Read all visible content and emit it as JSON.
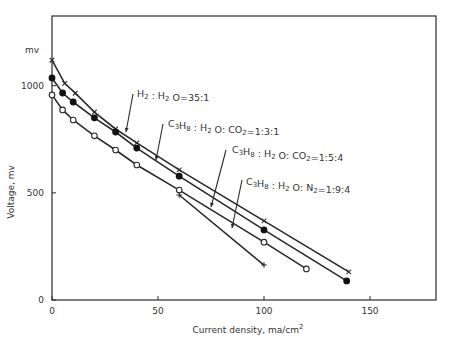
{
  "chart_data": {
    "type": "line",
    "title": "",
    "xlabel": "Current density, ma/cm",
    "xlabel_superscript": "2",
    "ylabel": "Voltage, mv",
    "y_unit_label": "mv",
    "xlim": [
      0,
      180
    ],
    "ylim": [
      0,
      1300
    ],
    "xticks": [
      0,
      50,
      100,
      150
    ],
    "yticks": [
      0,
      500,
      1000
    ],
    "xtick_labels": [
      "0",
      "50",
      "100",
      "150"
    ],
    "ytick_labels": [
      "0",
      "500",
      "1000"
    ],
    "grid": false,
    "legend": "inline annotations with arrows",
    "series": [
      {
        "name": "H2 : H2O = 35:1",
        "marker": "x",
        "x": [
          0,
          6,
          11,
          20,
          30,
          40,
          60,
          100,
          140
        ],
        "y": [
          1119,
          1011,
          965,
          877,
          798,
          733,
          607,
          369,
          131
        ]
      },
      {
        "name": "C3H8 : H2O : CO2 = 1:3:1",
        "marker": "filled-circle",
        "x": [
          0,
          5,
          10,
          20,
          30,
          40,
          60,
          100,
          139
        ],
        "y": [
          1036,
          966,
          924,
          850,
          784,
          709,
          578,
          327,
          89
        ]
      },
      {
        "name": "C3H8 : H2O : CO2 = 1:5:4",
        "marker": "open-circle",
        "x": [
          0,
          5,
          10,
          20,
          30,
          40,
          60,
          100,
          120
        ],
        "y": [
          957,
          887,
          840,
          766,
          700,
          630,
          513,
          270,
          145
        ]
      },
      {
        "name": "C3H8 : H2O : N2 = 1:9:4",
        "marker": "plus",
        "x": [
          60,
          100
        ],
        "y": [
          490,
          163
        ]
      }
    ],
    "annotations": [
      {
        "parts": [
          [
            "H",
            "2"
          ],
          [
            " : H",
            "2"
          ],
          [
            " O=35:1",
            ""
          ]
        ],
        "target_series": 0
      },
      {
        "parts": [
          [
            "C",
            "3"
          ],
          [
            "H",
            "8"
          ],
          [
            " : H",
            "2"
          ],
          [
            " O: CO",
            "2"
          ],
          [
            "=1:3:1",
            ""
          ]
        ],
        "target_series": 1
      },
      {
        "parts": [
          [
            "C",
            "3"
          ],
          [
            "H",
            "8"
          ],
          [
            " : H",
            "2"
          ],
          [
            " O: CO",
            "2"
          ],
          [
            "=1:5:4",
            ""
          ]
        ],
        "target_series": 2
      },
      {
        "parts": [
          [
            "C",
            "3"
          ],
          [
            "H",
            "8"
          ],
          [
            " : H",
            "2"
          ],
          [
            " O: N",
            "2"
          ],
          [
            "=1:9:4",
            ""
          ]
        ],
        "target_series": 3
      }
    ]
  }
}
